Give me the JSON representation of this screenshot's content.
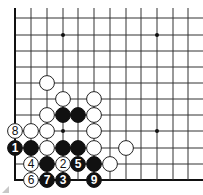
{
  "diagram": {
    "type": "go-board-partial",
    "corner": "bottom-left",
    "columns_visible": 12,
    "rows_visible": 11,
    "grid": {
      "x": [
        15,
        31,
        47,
        63,
        78,
        94,
        110,
        126,
        141,
        157,
        173,
        188
      ],
      "y": [
        18,
        35,
        51,
        67,
        83,
        99,
        115,
        131,
        148,
        164,
        180
      ],
      "top_extends_to": 8,
      "right_extends_to": 203,
      "line_color": "#333333",
      "edge_color": "#111111"
    },
    "star_points": [
      {
        "c": 3,
        "r": 1
      },
      {
        "c": 9,
        "r": 1
      },
      {
        "c": 9,
        "r": 7
      },
      {
        "c": 3,
        "r": 7
      }
    ],
    "stones": [
      {
        "c": 2,
        "r": 4,
        "color": "white",
        "label": ""
      },
      {
        "c": 3,
        "r": 5,
        "color": "white",
        "label": ""
      },
      {
        "c": 5,
        "r": 5,
        "color": "white",
        "label": ""
      },
      {
        "c": 2,
        "r": 6,
        "color": "white",
        "label": ""
      },
      {
        "c": 3,
        "r": 6,
        "color": "black",
        "label": ""
      },
      {
        "c": 4,
        "r": 6,
        "color": "black",
        "label": ""
      },
      {
        "c": 5,
        "r": 6,
        "color": "white",
        "label": ""
      },
      {
        "c": 0,
        "r": 7,
        "color": "white",
        "label": "8"
      },
      {
        "c": 1,
        "r": 7,
        "color": "white",
        "label": ""
      },
      {
        "c": 2,
        "r": 7,
        "color": "white",
        "label": ""
      },
      {
        "c": 5,
        "r": 7,
        "color": "white",
        "label": ""
      },
      {
        "c": 0,
        "r": 8,
        "color": "black",
        "label": "1"
      },
      {
        "c": 1,
        "r": 8,
        "color": "black",
        "label": ""
      },
      {
        "c": 2,
        "r": 8,
        "color": "white",
        "label": ""
      },
      {
        "c": 3,
        "r": 8,
        "color": "black",
        "label": ""
      },
      {
        "c": 4,
        "r": 8,
        "color": "black",
        "label": ""
      },
      {
        "c": 5,
        "r": 8,
        "color": "white",
        "label": ""
      },
      {
        "c": 7,
        "r": 8,
        "color": "white",
        "label": ""
      },
      {
        "c": 1,
        "r": 9,
        "color": "white",
        "label": "4"
      },
      {
        "c": 2,
        "r": 9,
        "color": "black",
        "label": ""
      },
      {
        "c": 3,
        "r": 9,
        "color": "white",
        "label": "2"
      },
      {
        "c": 4,
        "r": 9,
        "color": "black",
        "label": "5"
      },
      {
        "c": 5,
        "r": 9,
        "color": "black",
        "label": ""
      },
      {
        "c": 6,
        "r": 9,
        "color": "white",
        "label": ""
      },
      {
        "c": 1,
        "r": 10,
        "color": "white",
        "label": "6"
      },
      {
        "c": 2,
        "r": 10,
        "color": "black",
        "label": "7"
      },
      {
        "c": 3,
        "r": 10,
        "color": "black",
        "label": "3"
      },
      {
        "c": 5,
        "r": 10,
        "color": "black",
        "label": "9"
      }
    ],
    "stone_radius": 7.4,
    "colors": {
      "black_stone": "#111111",
      "white_stone": "#ffffff",
      "white_stroke": "#222222",
      "label_on_black": "#ffffff",
      "label_on_white": "#111111"
    }
  }
}
